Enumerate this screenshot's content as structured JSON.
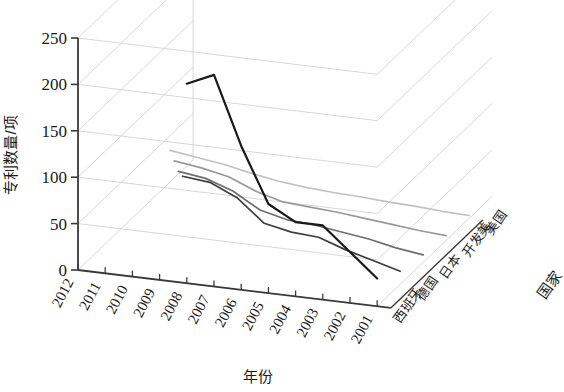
{
  "chart_data": {
    "type": "line",
    "projection": "3d",
    "title": "",
    "xlabel": "年份",
    "ylabel": "专利数量/项",
    "zlabel": "国家",
    "categories": [
      "2012",
      "2011",
      "2010",
      "2009",
      "2008",
      "2007",
      "2006",
      "2005",
      "2004",
      "2003",
      "2002",
      "2001"
    ],
    "ylim": [
      0,
      250
    ],
    "yticks": [
      0,
      50,
      100,
      150,
      200,
      250
    ],
    "grid": true,
    "legend_position": "right-depth-axis",
    "series": [
      {
        "name": "美国",
        "color": "#1a1a1a",
        "values": [
          null,
          null,
          null,
          null,
          215,
          228,
          155,
          96,
          80,
          80,
          55,
          30
        ]
      },
      {
        "name": "开发美",
        "color": "#3d3d3d",
        "values": [
          null,
          null,
          null,
          88,
          85,
          72,
          48,
          42,
          40,
          30,
          22,
          14
        ]
      },
      {
        "name": "日本",
        "color": "#6e6e6e",
        "values": [
          null,
          null,
          66,
          62,
          52,
          35,
          28,
          26,
          22,
          18,
          12,
          8
        ]
      },
      {
        "name": "德国",
        "color": "#9a9a9a",
        "values": [
          null,
          50,
          46,
          40,
          28,
          20,
          18,
          16,
          13,
          10,
          7,
          5
        ]
      },
      {
        "name": "西班牙",
        "color": "#c2c2c2",
        "values": [
          34,
          30,
          26,
          20,
          15,
          12,
          10,
          9,
          7,
          6,
          4,
          3
        ]
      }
    ]
  },
  "axes": {
    "y_title": "专利数量/项",
    "x_title": "年份",
    "z_title": "国家",
    "y_ticks": [
      "250",
      "200",
      "150",
      "100",
      "50",
      "0"
    ],
    "x_ticks": [
      "2012",
      "2011",
      "2010",
      "2009",
      "2008",
      "2007",
      "2006",
      "2005",
      "2004",
      "2003",
      "2002",
      "2001"
    ],
    "series_labels": [
      "美国",
      "开发美",
      "日本",
      "德国",
      "西班牙"
    ]
  },
  "colors": {
    "grid": "#d8d8d8",
    "axis": "#3a3a3a",
    "background": "#ffffff",
    "series": [
      "#1a1a1a",
      "#3d3d3d",
      "#6e6e6e",
      "#9a9a9a",
      "#c2c2c2"
    ]
  }
}
